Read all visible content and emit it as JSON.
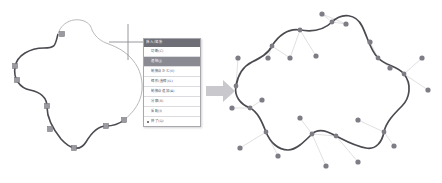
{
  "figure": {
    "kind": "vector-path-editing-illustration",
    "panels": [
      "before-with-context-menu",
      "after-with-bezier-handles"
    ]
  },
  "arrow": {
    "name": "right-arrow",
    "color": "#c9c9cd",
    "direction": "right"
  },
  "cursor": {
    "name": "crosshair-cursor",
    "color": "#8c8c92"
  },
  "context_menu": {
    "title": "挿入/編集",
    "selected_index": 1,
    "items": [
      {
        "label": "切断(C)",
        "selected": false,
        "bullet": false
      },
      {
        "label": "連結(J)",
        "selected": true,
        "bullet": false
      },
      {
        "label": "制御点かど(V)",
        "selected": false,
        "bullet": false
      },
      {
        "label": "線形(直線)(L)",
        "selected": false,
        "bullet": false
      },
      {
        "label": "制御点追加(A)",
        "selected": false,
        "bullet": false
      },
      {
        "label": "分解(X)",
        "selected": false,
        "bullet": false
      },
      {
        "label": "反転(I)",
        "selected": false,
        "bullet": false
      },
      {
        "label": "終了(Q)",
        "selected": false,
        "bullet": true
      }
    ]
  },
  "colors": {
    "curve_dark": "#4a4a50",
    "curve_light": "#b9b9bd",
    "node_square": "#9a9aa0",
    "node_dot": "#7d7d85",
    "handle_line": "#d2d2d6",
    "menu_titlebar": "#6e6e76",
    "menu_selected": "#8a8a92",
    "background": "#ffffff"
  },
  "left_shape": {
    "name": "path-before-edit",
    "dark_segment_path": "M 92,30 C 80,16 62,20 58,34 C 55,45 56,47 44,47 C 30,47 18,54 16,66 C 14,78 20,88 30,90 C 40,92 48,96 48,106 C 48,118 54,128 62,138 C 70,148 80,152 86,142 C 92,132 98,126 106,126 C 114,126 120,124 124,120",
    "light_segment_path": "M 124,120 C 132,114 140,104 142,92 C 144,78 140,66 132,58 C 124,50 116,46 108,44 C 100,42 96,38 92,30",
    "light_top_path": "M 58,34 C 62,24 74,18 84,22",
    "nodes": [
      {
        "x": 16,
        "y": 66
      },
      {
        "x": 18,
        "y": 80
      },
      {
        "x": 48,
        "y": 106
      },
      {
        "x": 50,
        "y": 128
      },
      {
        "x": 74,
        "y": 148
      },
      {
        "x": 106,
        "y": 126
      },
      {
        "x": 124,
        "y": 120
      },
      {
        "x": 62,
        "y": 30
      }
    ]
  },
  "right_shape": {
    "name": "path-after-edit",
    "path": "M 332,22 C 342,12 356,14 362,26 C 368,38 370,50 378,58 C 386,66 398,66 404,74 C 412,84 410,98 402,106 C 394,114 386,122 384,132 C 382,142 376,150 366,148 C 354,146 344,140 336,136 C 326,130 318,128 312,134 C 304,142 296,150 288,150 C 278,150 270,142 266,132 C 262,122 258,112 250,108 C 240,104 234,96 236,86 C 238,74 244,66 252,62 C 260,58 268,54 272,46 C 278,36 288,28 300,30 C 312,32 324,30 332,22",
    "anchors": [
      {
        "x": 332,
        "y": 22
      },
      {
        "x": 378,
        "y": 58
      },
      {
        "x": 404,
        "y": 74
      },
      {
        "x": 384,
        "y": 132
      },
      {
        "x": 336,
        "y": 136
      },
      {
        "x": 312,
        "y": 134
      },
      {
        "x": 266,
        "y": 132
      },
      {
        "x": 250,
        "y": 108
      },
      {
        "x": 236,
        "y": 86
      },
      {
        "x": 272,
        "y": 46
      },
      {
        "x": 300,
        "y": 30
      }
    ],
    "control_points": [
      {
        "x": 322,
        "y": 14,
        "anchor": 0
      },
      {
        "x": 346,
        "y": 24,
        "anchor": 0
      },
      {
        "x": 370,
        "y": 42,
        "anchor": 1
      },
      {
        "x": 390,
        "y": 68,
        "anchor": 2
      },
      {
        "x": 422,
        "y": 58,
        "anchor": 2
      },
      {
        "x": 428,
        "y": 90,
        "anchor": 3
      },
      {
        "x": 394,
        "y": 146,
        "anchor": 3
      },
      {
        "x": 358,
        "y": 162,
        "anchor": 4
      },
      {
        "x": 326,
        "y": 166,
        "anchor": 5
      },
      {
        "x": 300,
        "y": 118,
        "anchor": 5
      },
      {
        "x": 278,
        "y": 156,
        "anchor": 6
      },
      {
        "x": 240,
        "y": 148,
        "anchor": 7
      },
      {
        "x": 262,
        "y": 100,
        "anchor": 7
      },
      {
        "x": 232,
        "y": 108,
        "anchor": 8
      },
      {
        "x": 238,
        "y": 58,
        "anchor": 8
      },
      {
        "x": 268,
        "y": 58,
        "anchor": 9
      },
      {
        "x": 290,
        "y": 58,
        "anchor": 9
      },
      {
        "x": 316,
        "y": 56,
        "anchor": 10
      }
    ]
  }
}
